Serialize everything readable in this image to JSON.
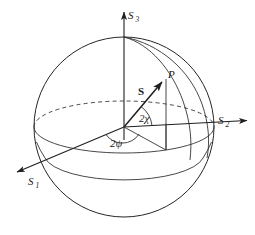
{
  "figure": {
    "background_color": "#ffffff",
    "line_color": "#262626",
    "width": 255,
    "height": 235
  },
  "labels": {
    "axis_s3_base": "S",
    "axis_s3_sub": "3",
    "axis_s2_base": "S",
    "axis_s2_sub": "2",
    "axis_s1_base": "S",
    "axis_s1_sub": "1",
    "point_p": "P",
    "vector_s": "S",
    "angle_chi": "2χ",
    "angle_psi": "2ψ"
  },
  "geometry": {
    "center_x": 124,
    "center_y": 127,
    "radius": 90,
    "equator_ry": 26,
    "point_p_x": 166,
    "point_p_y": 78,
    "s3_tip_x": 124,
    "s3_tip_y": 8,
    "s2_tip_x": 250,
    "s2_tip_y": 119,
    "s1_tip_x": 13,
    "s1_tip_y": 174
  },
  "elements": {
    "sphere_outline": "great-circle-outline",
    "equator_back": "dashed-rear-equator",
    "equator_front": "solid-front-equator",
    "meridian": "tilted-great-circle",
    "lower_circle": "solid-lower-latitude-arc",
    "projection_line": "vertical-drop-from-P",
    "azimuth_line": "equatorial-projection-ray",
    "chi_arc": "elevation-angle-arc",
    "psi_arc": "azimuth-angle-arc"
  }
}
